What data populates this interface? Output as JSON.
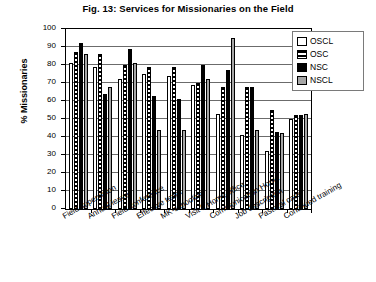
{
  "chart_data": {
    "type": "bar",
    "title": "Fig. 13:  Services for Missionaries on the Field",
    "xlabel": "",
    "ylabel": "% Missionaries",
    "ylim": [
      0,
      100
    ],
    "ytick_values": [
      0,
      10,
      20,
      30,
      40,
      50,
      60,
      70,
      80,
      90,
      100
    ],
    "ytick_labels": [
      "0",
      "10",
      "20",
      "30",
      "40",
      "50",
      "60",
      "70",
      "80",
      "90",
      "100"
    ],
    "grid": true,
    "legend_position": "top-right",
    "categories": [
      "Field supervision",
      "Annual leave",
      "Field conference",
      "Effective team",
      "MK-schooling",
      "Visit f. Home office",
      "Communication Home",
      "Job description",
      "Pastoral care",
      "Continued training"
    ],
    "series": [
      {
        "name": "OSCL",
        "color": "#ffffff",
        "values": [
          81,
          79,
          72,
          75,
          74,
          69,
          53,
          41,
          32,
          50
        ]
      },
      {
        "name": "OSC",
        "color": "#ffffff",
        "values": [
          87,
          86,
          80,
          79,
          79,
          70,
          68,
          68,
          55,
          52
        ]
      },
      {
        "name": "NSC",
        "color": "#000000",
        "values": [
          92,
          64,
          89,
          63,
          61,
          80,
          77,
          68,
          43,
          52
        ]
      },
      {
        "name": "NSCL",
        "color": "#a6a6a6",
        "values": [
          86,
          68,
          81,
          44,
          44,
          72,
          95,
          44,
          42,
          53
        ]
      }
    ]
  },
  "legend": {
    "items": [
      {
        "label": "OSCL"
      },
      {
        "label": "OSC"
      },
      {
        "label": "NSC"
      },
      {
        "label": "NSCL"
      }
    ]
  }
}
